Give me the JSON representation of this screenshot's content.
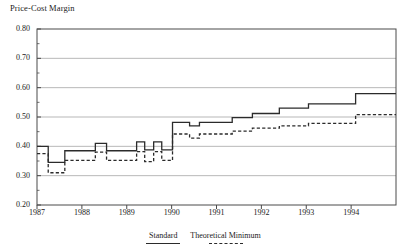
{
  "chart_data": {
    "type": "line",
    "title": "Price-Cost Margin",
    "subtitle": "",
    "xlabel": "",
    "ylabel": "Price-Cost Margin",
    "ylim": [
      0.2,
      0.8
    ],
    "xlim": [
      1987.0,
      1995.0
    ],
    "grid": true,
    "grid_axis": "y",
    "legend_position": "bottom-center",
    "ytick_labels": [
      "0.80",
      "0.70",
      "0.60",
      "0.50",
      "0.40",
      "0.30",
      "0.20"
    ],
    "ytick_values": [
      0.8,
      0.7,
      0.6,
      0.5,
      0.4,
      0.3,
      0.2
    ],
    "xtick_labels": [
      "1987",
      "1988",
      "1989",
      "1990",
      "1991",
      "1992",
      "1993",
      "1994"
    ],
    "xtick_values": [
      1987,
      1988,
      1989,
      1990,
      1991,
      1992,
      1993,
      1994
    ],
    "line_color": "#2b2b2b",
    "series": [
      {
        "name": "Standard",
        "style": "solid",
        "x": [
          1987.0,
          1987.25,
          1987.25,
          1987.62,
          1987.62,
          1988.3,
          1988.3,
          1988.55,
          1988.55,
          1989.22,
          1989.22,
          1989.4,
          1989.4,
          1989.6,
          1989.6,
          1989.78,
          1989.78,
          1990.02,
          1990.02,
          1990.4,
          1990.4,
          1990.62,
          1990.62,
          1991.35,
          1991.35,
          1991.8,
          1991.8,
          1992.4,
          1992.4,
          1993.05,
          1993.05,
          1994.1,
          1994.1,
          1994.45,
          1994.45,
          1995.0
        ],
        "y": [
          0.4,
          0.4,
          0.345,
          0.345,
          0.385,
          0.385,
          0.41,
          0.41,
          0.385,
          0.385,
          0.415,
          0.415,
          0.388,
          0.388,
          0.415,
          0.415,
          0.388,
          0.388,
          0.482,
          0.482,
          0.47,
          0.47,
          0.482,
          0.482,
          0.498,
          0.498,
          0.512,
          0.512,
          0.53,
          0.53,
          0.545,
          0.545,
          0.58,
          0.58,
          0.58,
          0.58
        ],
        "values_note": "step function; solid Standard margin"
      },
      {
        "name": "Theoretical Minimum",
        "style": "dashed",
        "x": [
          1987.0,
          1987.25,
          1987.25,
          1987.62,
          1987.62,
          1988.3,
          1988.3,
          1988.55,
          1988.55,
          1989.22,
          1989.22,
          1989.4,
          1989.4,
          1989.6,
          1989.6,
          1989.78,
          1989.78,
          1990.02,
          1990.02,
          1990.4,
          1990.4,
          1990.62,
          1990.62,
          1991.35,
          1991.35,
          1991.8,
          1991.8,
          1992.4,
          1992.4,
          1993.05,
          1993.05,
          1994.1,
          1994.1,
          1994.45,
          1994.45,
          1995.0
        ],
        "y": [
          0.375,
          0.375,
          0.31,
          0.31,
          0.352,
          0.352,
          0.38,
          0.38,
          0.352,
          0.352,
          0.382,
          0.382,
          0.348,
          0.348,
          0.382,
          0.382,
          0.352,
          0.352,
          0.442,
          0.442,
          0.428,
          0.428,
          0.442,
          0.442,
          0.452,
          0.452,
          0.462,
          0.462,
          0.47,
          0.47,
          0.478,
          0.478,
          0.508,
          0.508,
          0.508,
          0.508
        ],
        "values_note": "step function; dashed Theoretical Minimum margin"
      }
    ],
    "legend": [
      {
        "label": "Standard",
        "style": "solid"
      },
      {
        "label": "Theoretical Minimum",
        "style": "dashed"
      }
    ]
  }
}
